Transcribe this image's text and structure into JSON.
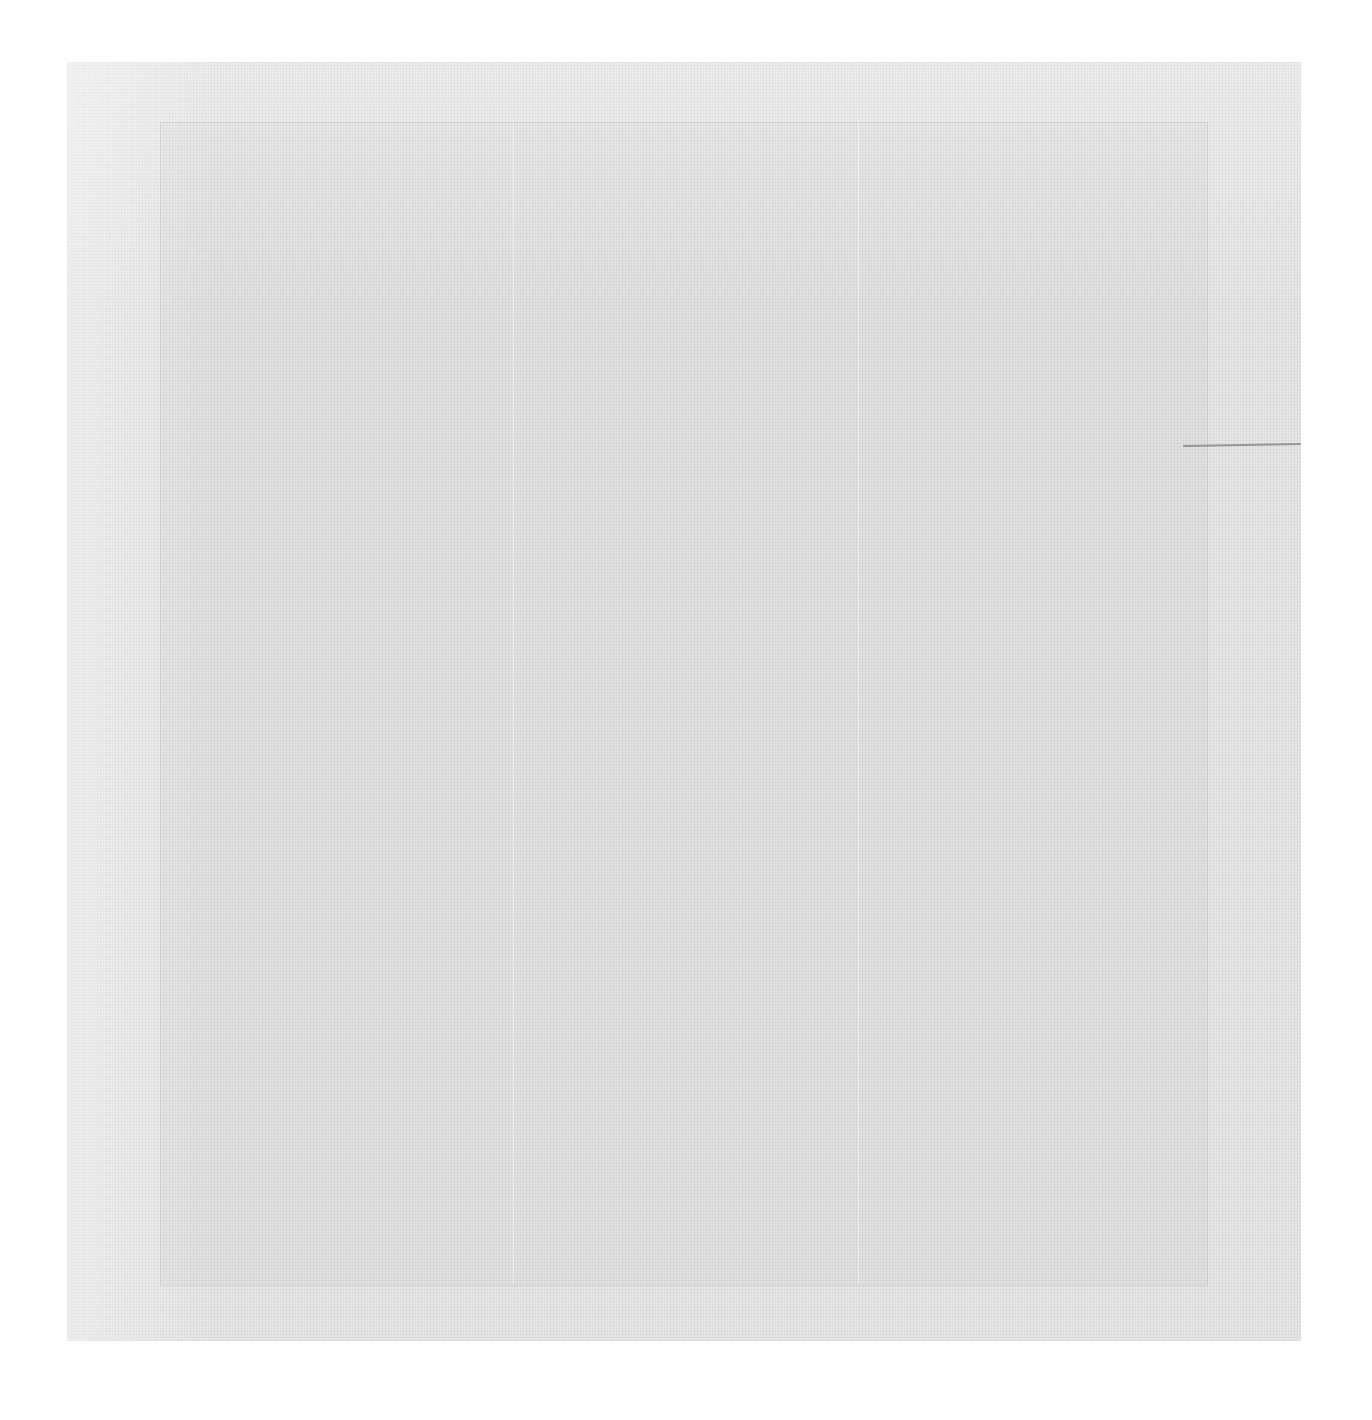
{
  "image": {
    "description": "Blank textured paper/linen canvas with faint inner frame and crease lines",
    "colors": {
      "page_background": "#ffffff",
      "canvas": "#e6e6e6",
      "mark": "#5a5a5a"
    }
  }
}
